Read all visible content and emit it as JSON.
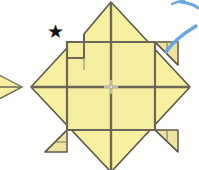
{
  "figure": {
    "background_color": "#fdfdfb",
    "canvas": {
      "width": 199,
      "height": 170
    }
  },
  "colors": {
    "paper_front": "#f7f0a0",
    "paper_front_alt": "#f5eda0",
    "paper_shade": "#e8e0a8",
    "crease_line": "#6b6655",
    "outline": "#5e5a4a",
    "star": "#111111",
    "arrow_blue": "#6aa6e0",
    "white": "#ffffff"
  },
  "main_model": {
    "name": "folded-square-base",
    "description": "Yellow square folded into a diamond orientation with four corner flaps folded in and a grid of creases",
    "diamond": {
      "top_apex": [
        111,
        2
      ],
      "right_apex": [
        190,
        87
      ],
      "bottom_apex": [
        111,
        172
      ],
      "left_apex": [
        31,
        87
      ]
    },
    "inner_square": {
      "left": 67,
      "top": 42,
      "right": 155,
      "bottom": 130
    },
    "grid_center": [
      111,
      87
    ],
    "corner_flaps": [
      {
        "name": "flap-right",
        "position": "top-right"
      },
      {
        "name": "flap-bottom-left",
        "position": "bottom-left"
      },
      {
        "name": "flap-bottom-right",
        "position": "bottom-right"
      }
    ],
    "notch": {
      "name": "upper-left-notch",
      "left": 67,
      "top": 42,
      "right": 84,
      "bottom": 58
    }
  },
  "partial_model": {
    "name": "previous-step-tip",
    "description": "Right-hand tip of the preceding diagram, cropped at the left edge"
  },
  "annotations": {
    "star": {
      "name": "star-marker",
      "glyph": "★",
      "x": 47,
      "y": 23,
      "size": 17
    },
    "arrow": {
      "name": "blue-fold-arrow",
      "description": "Blue curved arrow stroke in the upper-right corner"
    }
  },
  "labels": {
    "caption": "",
    "step_number": ""
  }
}
